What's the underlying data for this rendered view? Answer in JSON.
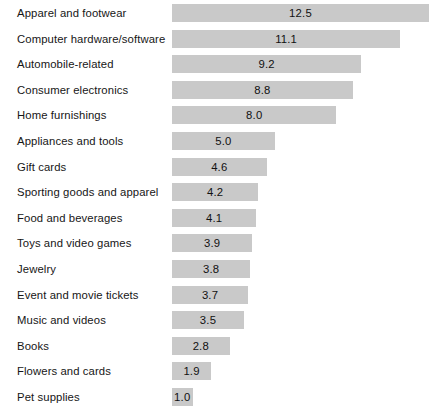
{
  "chart_data": {
    "type": "bar",
    "orientation": "horizontal",
    "title": "",
    "subtitle": "",
    "xlabel": "",
    "ylabel": "",
    "grid": false,
    "legend": null,
    "axis_visible": false,
    "value_label_position": "inside-center",
    "xlim": [
      0,
      12.5
    ],
    "bar_color": "#c9c9c9",
    "text_color": "#161616",
    "background": "#ffffff",
    "categories": [
      "Apparel and footwear",
      "Computer hardware/software",
      "Automobile-related",
      "Consumer electronics",
      "Home furnishings",
      "Appliances and tools",
      "Gift cards",
      "Sporting goods and apparel",
      "Food and beverages",
      "Toys and video games",
      "Jewelry",
      "Event and movie tickets",
      "Music and videos",
      "Books",
      "Flowers and cards",
      "Pet supplies"
    ],
    "values": [
      12.5,
      11.1,
      9.2,
      8.8,
      8.0,
      5.0,
      4.6,
      4.2,
      4.1,
      3.9,
      3.8,
      3.7,
      3.5,
      2.8,
      1.9,
      1.0
    ],
    "value_labels": [
      "12.5",
      "11.1",
      "9.2",
      "8.8",
      "8.0",
      "5.0",
      "4.6",
      "4.2",
      "4.1",
      "3.9",
      "3.8",
      "3.7",
      "3.5",
      "2.8",
      "1.9",
      "1.0"
    ]
  }
}
